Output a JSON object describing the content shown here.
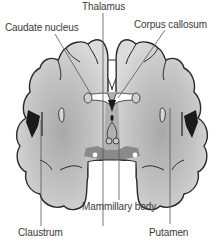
{
  "diagram": {
    "type": "coronal-brain-section",
    "labels": {
      "thalamus": "Thalamus",
      "caudate_nucleus": "Caudate nucleus",
      "corpus_callosum": "Corpus callosum",
      "mammillary_body": "Mammillary body",
      "claustrum": "Claustrum",
      "putamen": "Putamen"
    },
    "colors": {
      "tissue_light": "#d8d8d8",
      "tissue_dark": "#a8a8a8",
      "outline": "#2a2a2a",
      "ventricle": "#ffffff",
      "base_band": "#8a8a8a",
      "leader_line": "#444444"
    }
  }
}
